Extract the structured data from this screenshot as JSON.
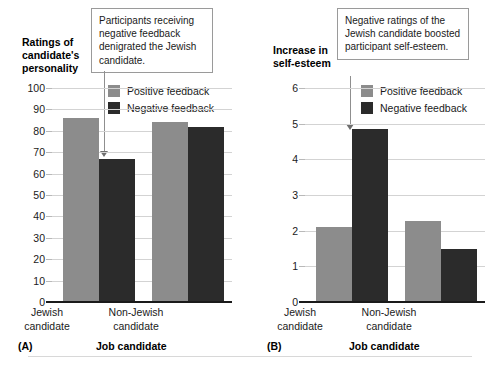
{
  "figure": {
    "background": "#ffffff",
    "colors": {
      "positive": "#8c8c8c",
      "negative": "#2b2b2b",
      "gridline": "#d3d3d3",
      "axis": "#1a1a1a",
      "callout_border": "#9a9a9a",
      "arrow": "#8f8f8f"
    }
  },
  "chart_data": [
    {
      "type": "bar",
      "panel": "A",
      "panel_letter": "(A)",
      "title": "",
      "ylabel": "Ratings of\ncandidate's\npersonality",
      "xlabel": "Job candidate",
      "categories": [
        "Jewish\ncandidate",
        "Non-Jewish\ncandidate"
      ],
      "series": [
        {
          "name": "Positive feedback",
          "color": "#8c8c8c",
          "values": [
            86,
            84
          ]
        },
        {
          "name": "Negative feedback",
          "color": "#2b2b2b",
          "values": [
            67,
            82
          ]
        }
      ],
      "ylim": [
        0,
        100
      ],
      "yticks": [
        0,
        10,
        20,
        30,
        40,
        50,
        60,
        70,
        80,
        90,
        100
      ],
      "grid": true,
      "legend_position": "top-right",
      "annotation": "Participants receiving negative feedback denigrated the Jewish candidate.",
      "annotation_target": "Negative feedback bar, Jewish candidate"
    },
    {
      "type": "bar",
      "panel": "B",
      "panel_letter": "(B)",
      "title": "",
      "ylabel": "Increase in\nself-esteem",
      "xlabel": "Job candidate",
      "categories": [
        "Jewish\ncandidate",
        "Non-Jewish\ncandidate"
      ],
      "series": [
        {
          "name": "Positive feedback",
          "color": "#8c8c8c",
          "values": [
            2.1,
            2.27
          ]
        },
        {
          "name": "Negative feedback",
          "color": "#2b2b2b",
          "values": [
            4.85,
            1.48
          ]
        }
      ],
      "ylim": [
        0,
        6
      ],
      "yticks": [
        0,
        1,
        2,
        3,
        4,
        5,
        6
      ],
      "grid": true,
      "legend_position": "top-right",
      "annotation": "Negative ratings of the Jewish candidate boosted participant self-esteem.",
      "annotation_target": "Negative feedback bar, Jewish candidate"
    }
  ]
}
